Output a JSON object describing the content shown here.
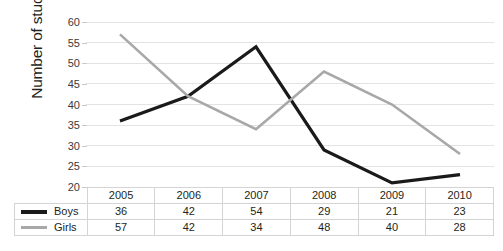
{
  "chart_data": {
    "type": "line",
    "title": "",
    "xlabel": "",
    "ylabel": "Number of students",
    "categories": [
      "2005",
      "2006",
      "2007",
      "2008",
      "2009",
      "2010"
    ],
    "ylim": [
      20,
      60
    ],
    "ytick_step": 5,
    "yticks": [
      "60",
      "55",
      "50",
      "45",
      "40",
      "35",
      "30",
      "25",
      "20"
    ],
    "grid": true,
    "legend_position": "table-left",
    "series": [
      {
        "name": "Boys",
        "color": "#1a1a1a",
        "values": [
          36,
          42,
          54,
          29,
          21,
          23
        ]
      },
      {
        "name": "Girls",
        "color": "#a8a8a8",
        "values": [
          57,
          42,
          34,
          48,
          40,
          28
        ]
      }
    ]
  },
  "table": {
    "header": [
      "2005",
      "2006",
      "2007",
      "2008",
      "2009",
      "2010"
    ],
    "rows": [
      {
        "label": "Boys",
        "swatch": "boys",
        "values": [
          "36",
          "42",
          "54",
          "29",
          "21",
          "23"
        ]
      },
      {
        "label": "Girls",
        "swatch": "girls",
        "values": [
          "57",
          "42",
          "34",
          "48",
          "40",
          "28"
        ]
      }
    ]
  },
  "icons": {
    "boys_swatch": "line-swatch-black-icon",
    "girls_swatch": "line-swatch-gray-icon"
  }
}
